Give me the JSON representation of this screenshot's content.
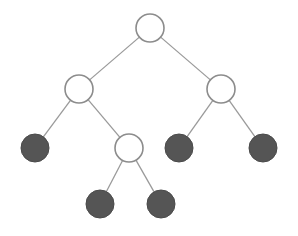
{
  "diagram": {
    "type": "binary-tree",
    "colors": {
      "background": "#ffffff",
      "edge": "#9a9a9a",
      "internal_fill": "#ffffff",
      "internal_stroke": "#8c8c8c",
      "leaf_fill": "#555555"
    },
    "node_radius": 14,
    "nodes": [
      {
        "id": "root",
        "kind": "internal",
        "x": 150,
        "y": 28
      },
      {
        "id": "l",
        "kind": "internal",
        "x": 79,
        "y": 89
      },
      {
        "id": "r",
        "kind": "internal",
        "x": 221,
        "y": 89
      },
      {
        "id": "ll",
        "kind": "leaf",
        "x": 35,
        "y": 148
      },
      {
        "id": "lr",
        "kind": "internal",
        "x": 129,
        "y": 148
      },
      {
        "id": "rl",
        "kind": "leaf",
        "x": 179,
        "y": 148
      },
      {
        "id": "rr",
        "kind": "leaf",
        "x": 263,
        "y": 148
      },
      {
        "id": "lrl",
        "kind": "leaf",
        "x": 100,
        "y": 204
      },
      {
        "id": "lrr",
        "kind": "leaf",
        "x": 161,
        "y": 204
      }
    ],
    "edges": [
      [
        "root",
        "l"
      ],
      [
        "root",
        "r"
      ],
      [
        "l",
        "ll"
      ],
      [
        "l",
        "lr"
      ],
      [
        "r",
        "rl"
      ],
      [
        "r",
        "rr"
      ],
      [
        "lr",
        "lrl"
      ],
      [
        "lr",
        "lrr"
      ]
    ]
  }
}
